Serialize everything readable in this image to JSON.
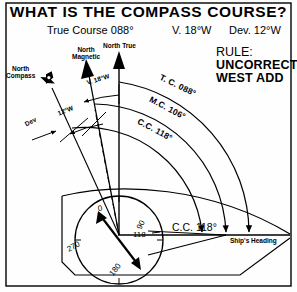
{
  "figure": {
    "title": "WHAT IS THE COMPASS COURSE?",
    "givens": {
      "true_course": "True Course 088°",
      "variation": "V. 18°W",
      "deviation": "Dev. 12°W"
    },
    "rule": {
      "heading": "RULE:",
      "line1": "UNCORRECT",
      "line2": "WEST ADD"
    },
    "north_labels": {
      "magnetic": "North\nMagnetic",
      "magnetic_l1": "North",
      "magnetic_l2": "Magnetic",
      "true": "North True",
      "compass_l1": "North",
      "compass_l2": "Compass"
    },
    "angle_labels": {
      "variation_arc": "V. 18°W",
      "deviation_arc": "12°W",
      "deviation_pointer": "Dev"
    },
    "course_arcs": [
      {
        "label": "T. C. 088°",
        "name": "true-course-arc",
        "value": 88
      },
      {
        "label": "M.C. 106°",
        "name": "magnetic-course-arc",
        "value": 106
      },
      {
        "label": "C.C. 118°",
        "name": "compass-course-arc",
        "value": 118
      }
    ],
    "result": {
      "compass_course": "C.C. 118°",
      "ships_heading": "Ship's Heading"
    },
    "compass_rose": {
      "ticks": [
        "0",
        "90",
        "180",
        "270"
      ],
      "tick_0": "0",
      "tick_90": "90",
      "tick_180": "180",
      "tick_270": "270",
      "heading_mark": "118"
    },
    "colors": {
      "ink": "#000000",
      "paper": "#fefefe"
    }
  }
}
